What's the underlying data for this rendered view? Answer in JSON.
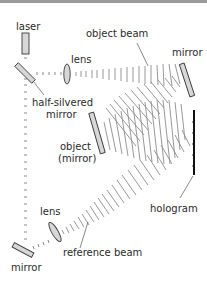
{
  "diagram": {
    "labels": {
      "laser": "laser",
      "object_beam": "object beam",
      "lens_top": "lens",
      "mirror_top": "mirror",
      "half_silvered_line1": "half-silvered",
      "half_silvered_line2": "mirror",
      "object_line1": "object",
      "object_line2": "(mirror)",
      "hologram": "hologram",
      "lens_bottom": "lens",
      "reference_beam": "reference beam",
      "mirror_bottom": "mirror"
    },
    "components": [
      {
        "id": "laser",
        "type": "light-source"
      },
      {
        "id": "half-silvered-mirror",
        "type": "beam-splitter"
      },
      {
        "id": "lens-top",
        "type": "lens"
      },
      {
        "id": "mirror-top",
        "type": "mirror"
      },
      {
        "id": "object-mirror",
        "type": "object"
      },
      {
        "id": "hologram-plate",
        "type": "film"
      },
      {
        "id": "lens-bottom",
        "type": "lens"
      },
      {
        "id": "mirror-bottom",
        "type": "mirror"
      }
    ],
    "colors": {
      "optic_fill": "#d7d7d7",
      "outline": "#3a3a3a",
      "wavefront": "#8c8c8c",
      "hologram": "#111111",
      "top_bar": "#9a9a9a"
    }
  }
}
